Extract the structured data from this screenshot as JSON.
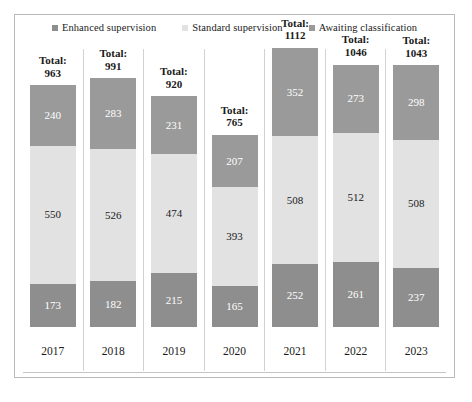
{
  "chart_data": {
    "type": "bar",
    "subtype": "stacked-column",
    "title": "",
    "xlabel": "",
    "ylabel": "",
    "grid": false,
    "legend_position": "top-center",
    "axis_max": 1200,
    "categories": [
      "2017",
      "2018",
      "2019",
      "2020",
      "2021",
      "2022",
      "2023"
    ],
    "series": [
      {
        "name": "Enhanced supervision",
        "color": "#8e8e8e",
        "stack_position": "bottom",
        "values": [
          173,
          182,
          215,
          165,
          252,
          261,
          237
        ]
      },
      {
        "name": "Standard supervision",
        "color": "#e2e2e2",
        "stack_position": "middle",
        "values": [
          550,
          526,
          474,
          393,
          508,
          512,
          508
        ]
      },
      {
        "name": "Awaiting classification",
        "color": "#9a9a9a",
        "stack_position": "top",
        "values": [
          240,
          283,
          231,
          207,
          352,
          273,
          298
        ]
      }
    ],
    "totals": [
      963,
      991,
      920,
      765,
      1112,
      1046,
      1043
    ],
    "total_prefix": "Total:"
  },
  "legend": {
    "items": [
      {
        "label": "Enhanced supervision",
        "color": "#8e8e8e"
      },
      {
        "label": "Standard supervision",
        "color": "#e2e2e2"
      },
      {
        "label": "Awaiting classification",
        "color": "#9a9a9a"
      }
    ]
  }
}
